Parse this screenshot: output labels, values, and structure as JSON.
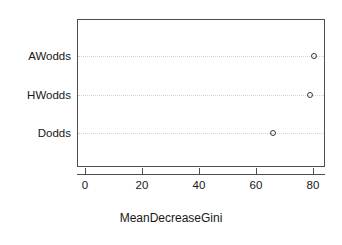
{
  "chart_data": {
    "type": "scatter",
    "title": "",
    "subtitle": "",
    "xlabel": "MeanDecreaseGini",
    "ylabel": "",
    "categories": [
      "Dodds",
      "HWodds",
      "AWodds"
    ],
    "values": [
      66.0,
      79.0,
      80.4
    ],
    "points": [
      {
        "label": "AWodds",
        "value": 80.4
      },
      {
        "label": "HWodds",
        "value": 79.0
      },
      {
        "label": "Dodds",
        "value": 66.0
      }
    ],
    "xlim": [
      -3,
      84
    ],
    "xticks": [
      0,
      20,
      40,
      60,
      80
    ],
    "xtick_labels": [
      "0",
      "20",
      "40",
      "60",
      "80"
    ],
    "grid": true,
    "grid_orientation": "horizontal",
    "legend": false,
    "legend_position": "none",
    "marker": "open-circle",
    "marker_color": "#3a3a3a",
    "frame_color": "#4d4d4d",
    "background": "#ffffff"
  },
  "axis": {
    "x_title": "MeanDecreaseGini",
    "ticks": [
      {
        "label": "0"
      },
      {
        "label": "20"
      },
      {
        "label": "40"
      },
      {
        "label": "60"
      },
      {
        "label": "80"
      }
    ]
  },
  "rows": [
    {
      "label": "AWodds",
      "value": 80.4
    },
    {
      "label": "HWodds",
      "value": 79.0
    },
    {
      "label": "Dodds",
      "value": 66.0
    }
  ]
}
